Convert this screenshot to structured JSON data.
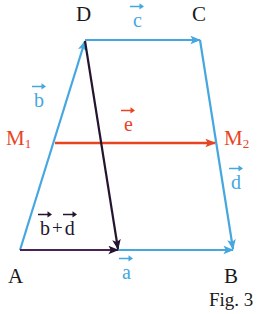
{
  "figure": {
    "caption": "Fig. 3",
    "background": "#ffffff",
    "colors": {
      "blue": "#46a7e0",
      "red": "#e8441f",
      "dark_purple": "#241430",
      "label_black": "#1a1a1a"
    },
    "vertices": [
      {
        "name": "A",
        "label": "A",
        "x": 20,
        "y": 250
      },
      {
        "name": "B",
        "label": "B",
        "x": 233,
        "y": 250
      },
      {
        "name": "C",
        "label": "C",
        "x": 200,
        "y": 40
      },
      {
        "name": "D",
        "label": "D",
        "x": 85,
        "y": 40
      }
    ],
    "midpoints": [
      {
        "name": "M1",
        "letter": "M",
        "subscript": "1",
        "x": 55,
        "y": 143,
        "color": "#e8441f"
      },
      {
        "name": "M2",
        "letter": "M",
        "subscript": "2",
        "x": 215,
        "y": 143,
        "color": "#e8441f"
      }
    ],
    "vectors": [
      {
        "name": "a",
        "letter": "a",
        "color": "#46a7e0",
        "from": "A",
        "to": "B",
        "label_x": 122,
        "label_y": 258
      },
      {
        "name": "b",
        "letter": "b",
        "color": "#46a7e0",
        "from": "A",
        "to": "D",
        "label_x": 34,
        "label_y": 86
      },
      {
        "name": "c",
        "letter": "c",
        "color": "#46a7e0",
        "from": "D",
        "to": "C",
        "label_x": 133,
        "label_y": 6
      },
      {
        "name": "d",
        "letter": "d",
        "color": "#46a7e0",
        "from": "C",
        "to": "B",
        "label_x": 231,
        "label_y": 168
      },
      {
        "name": "e",
        "letter": "e",
        "color": "#e8441f",
        "from": "M1",
        "to": "M2",
        "label_x": 124,
        "label_y": 110
      }
    ],
    "sum_vector": {
      "name": "b-plus-d",
      "first": "b",
      "plus": "+",
      "second": "d",
      "color": "#241430",
      "label_x": 40,
      "label_y": 214
    }
  }
}
